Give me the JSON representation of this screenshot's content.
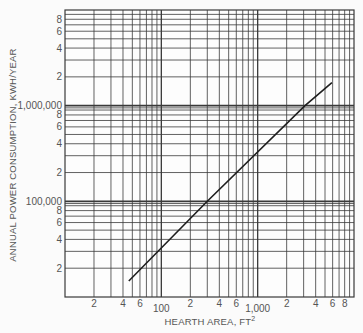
{
  "chart_data": {
    "type": "line",
    "title": "",
    "xlabel": "HEARTH AREA, FT",
    "xlabel_superscript": "2",
    "ylabel": "ANNUAL POWER CONSUMPTION, KWH/YEAR",
    "xscale": "log",
    "yscale": "log",
    "xlim": [
      10,
      10000
    ],
    "ylim": [
      10000,
      10000000
    ],
    "grid": true,
    "x_tick_labels": [
      {
        "value": 20,
        "label": "2"
      },
      {
        "value": 40,
        "label": "4"
      },
      {
        "value": 60,
        "label": "6"
      },
      {
        "value": 100,
        "label": "100"
      },
      {
        "value": 200,
        "label": "2"
      },
      {
        "value": 400,
        "label": "4"
      },
      {
        "value": 600,
        "label": "6"
      },
      {
        "value": 1000,
        "label": "1,000"
      },
      {
        "value": 2000,
        "label": "2"
      },
      {
        "value": 4000,
        "label": "4"
      },
      {
        "value": 6000,
        "label": "6"
      },
      {
        "value": 8000,
        "label": "8"
      }
    ],
    "y_tick_labels": [
      {
        "value": 20000,
        "label": "2"
      },
      {
        "value": 40000,
        "label": "4"
      },
      {
        "value": 60000,
        "label": "6"
      },
      {
        "value": 80000,
        "label": "8"
      },
      {
        "value": 100000,
        "label": "100,000"
      },
      {
        "value": 200000,
        "label": "2"
      },
      {
        "value": 400000,
        "label": "4"
      },
      {
        "value": 600000,
        "label": "6"
      },
      {
        "value": 800000,
        "label": "8"
      },
      {
        "value": 1000000,
        "label": "1,000,000"
      },
      {
        "value": 2000000,
        "label": "2"
      },
      {
        "value": 4000000,
        "label": "4"
      },
      {
        "value": 6000000,
        "label": "6"
      },
      {
        "value": 8000000,
        "label": "8"
      }
    ],
    "series": [
      {
        "name": "Annual power consumption vs hearth area",
        "x": [
          46,
          300,
          3100,
          5900
        ],
        "y": [
          14700,
          100000,
          1000000,
          1740000
        ]
      }
    ],
    "legend": null
  },
  "colors": {
    "background": "#fbfbfb",
    "grid": "#3a3a3a",
    "line": "#1e1e1e",
    "text": "#555555"
  }
}
